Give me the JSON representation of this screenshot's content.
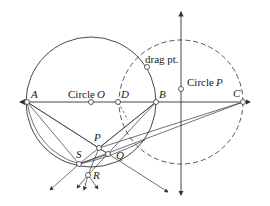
{
  "diagram": {
    "colors": {
      "stroke": "#333333",
      "background": "#ffffff"
    },
    "labels": {
      "A": "A",
      "B": "B",
      "C": "C",
      "D": "D",
      "P": "P",
      "Q": "Q",
      "R": "R",
      "S": "S",
      "circle_o_prefix": "Circle",
      "circle_o_name": "O",
      "circle_p_prefix": "Circle",
      "circle_p_name": "P",
      "drag_point": "drag pt."
    },
    "points": [
      {
        "name": "A",
        "x": 27,
        "y": 102
      },
      {
        "name": "O",
        "x": 91,
        "y": 102
      },
      {
        "name": "D",
        "x": 118,
        "y": 102
      },
      {
        "name": "B",
        "x": 156,
        "y": 102
      },
      {
        "name": "C",
        "x": 243,
        "y": 102
      },
      {
        "name": "circle-P-point",
        "x": 181,
        "y": 89
      },
      {
        "name": "drag-pt",
        "x": 147,
        "y": 67
      },
      {
        "name": "P",
        "x": 99,
        "y": 148
      },
      {
        "name": "Q-node",
        "x": 108,
        "y": 154
      },
      {
        "name": "S",
        "x": 79,
        "y": 164
      },
      {
        "name": "R",
        "x": 88,
        "y": 175
      }
    ],
    "circles": [
      {
        "name": "Circle O",
        "cx": 91,
        "cy": 102,
        "r": 65,
        "style": "solid"
      },
      {
        "name": "Circle P",
        "cx": 181,
        "cy": 102,
        "r": 62,
        "style": "dashed"
      }
    ]
  }
}
